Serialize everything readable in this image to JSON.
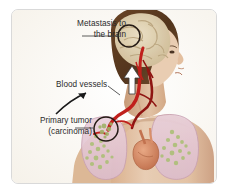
{
  "figure": {
    "kind": "medical-illustration",
    "frame": {
      "border_color": "#d9d9d9",
      "background_color": "#fdfcf9"
    }
  },
  "labels": {
    "metastasis": {
      "line1": "Metastasis to",
      "line2": "the brain"
    },
    "blood_vessels": {
      "line1": "Blood vessels"
    },
    "primary_tumor": {
      "line1": "Primary tumor",
      "line2": "(carcinoma)"
    }
  },
  "colors": {
    "text": "#2b2b2b",
    "leader_line": "#4a4a4a",
    "circle_marker": "#241a14",
    "artery_red": "#c0201c",
    "vein_dark_red": "#8f1512",
    "skin_light": "#e8cdb4",
    "skin_mid": "#dcb896",
    "skin_shadow": "#c49a77",
    "hair_brown": "#5e3a22",
    "brain_tan": "#ded0b0",
    "brain_fold": "#b9a47e",
    "lung_pink": "#e4c6d2",
    "lung_edge": "#c79fb1",
    "bronchi_green": "#a9bf72",
    "heart_orange": "#d98f6a",
    "arrow_white": "#ffffff",
    "arrow_black": "#1a1a1a",
    "background_cream": "#fdfcf9"
  },
  "markers": {
    "brain_circle": {
      "label": "metastatic lesion in brain",
      "cx": 117,
      "cy": 26,
      "r": 11
    },
    "tumor_circle": {
      "label": "primary tumor in lung",
      "cx": 94,
      "cy": 119,
      "r": 12
    },
    "white_arrow": {
      "label": "tumor cell travel direction toward brain",
      "direction": "up"
    },
    "curved_arrow": {
      "label": "pointer to blood vessels",
      "direction": "up-right"
    }
  }
}
